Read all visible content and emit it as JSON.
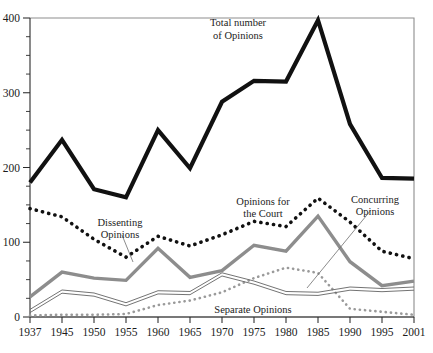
{
  "chart_data": {
    "type": "line",
    "title": "",
    "xlabel": "",
    "ylabel": "",
    "ylim": [
      0,
      400
    ],
    "yticks": [
      0,
      100,
      200,
      300,
      400
    ],
    "ytick_labels": [
      "0",
      "100",
      "200",
      "300",
      "400"
    ],
    "yminor_step": 25,
    "grid": false,
    "legend_position": "inline-annotations",
    "categories": [
      1937,
      1945,
      1950,
      1955,
      1960,
      1965,
      1970,
      1975,
      1980,
      1985,
      1990,
      1995,
      2001
    ],
    "xtick_labels": [
      "1937",
      "1945",
      "1950",
      "1955",
      "1960",
      "1965",
      "1970",
      "1975",
      "1980",
      "1985",
      "1990",
      "1995",
      "2001"
    ],
    "series": [
      {
        "name": "Total number of Opinions",
        "style": "thick-black-solid",
        "color": "#111111",
        "values": [
          180,
          237,
          171,
          160,
          250,
          199,
          288,
          316,
          315,
          397,
          258,
          186,
          185
        ]
      },
      {
        "name": "Dissenting Opinions",
        "style": "thick-black-dotted",
        "color": "#111111",
        "values": [
          145,
          134,
          104,
          80,
          108,
          95,
          110,
          128,
          121,
          159,
          127,
          88,
          78
        ]
      },
      {
        "name": "Opinions for the Court",
        "style": "thick-gray-solid",
        "color": "#8d8d8d",
        "values": [
          27,
          60,
          52,
          49,
          92,
          53,
          62,
          96,
          88,
          135,
          74,
          42,
          48
        ]
      },
      {
        "name": "Concurring Opinions",
        "style": "thin-gray-double",
        "color": "#6b6b6b",
        "values": [
          8,
          34,
          30,
          17,
          33,
          32,
          57,
          46,
          32,
          31,
          38,
          36,
          38
        ]
      },
      {
        "name": "Separate Opinions",
        "style": "gray-dotted",
        "color": "#9a9a9a",
        "values": [
          2,
          3,
          3,
          4,
          16,
          22,
          33,
          52,
          66,
          59,
          11,
          7,
          3
        ]
      }
    ],
    "annotations": [
      {
        "id": "total-label",
        "line1": "Total number",
        "line2": "of Opinions",
        "target_series": "Total number of Opinions",
        "leader": false
      },
      {
        "id": "dissenting-label",
        "line1": "Dissenting",
        "line2": "Opinions",
        "target_series": "Dissenting Opinions",
        "leader": true
      },
      {
        "id": "court-label",
        "line1": "Opinions for",
        "line2": "the Court",
        "target_series": "Opinions for the Court",
        "leader": false
      },
      {
        "id": "concurring-label",
        "line1": "Concurring",
        "line2": "Opinions",
        "target_series": "Concurring Opinions",
        "leader": true
      },
      {
        "id": "separate-label",
        "line1": "Separate Opinions",
        "line2": "",
        "target_series": "Separate Opinions",
        "leader": false
      }
    ],
    "colors": {
      "background": "#ffffff",
      "frame": "#8d8d8d",
      "axis": "#2a2a2a",
      "text": "#1b1b1b",
      "total": "#111111",
      "dissenting": "#111111",
      "court": "#8d8d8d",
      "concurring": "#6b6b6b",
      "separate": "#9a9a9a"
    }
  }
}
